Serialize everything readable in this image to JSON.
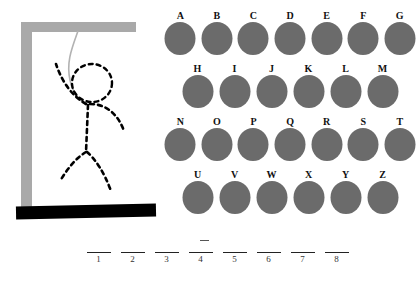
{
  "game": {
    "title": "Hangman",
    "colors": {
      "gallows_wood": "#a9a9a9",
      "gallows_base": "#000000",
      "letter_circle": "#6b6b6b",
      "figure_stroke": "#000000",
      "rope": "#b0b0b0",
      "background": "#ffffff"
    }
  },
  "gallows": {
    "post_label": "gallows-post",
    "beam_label": "gallows-beam",
    "base_label": "gallows-base",
    "rope_label": "hangman-rope",
    "figure_parts": [
      "head",
      "torso",
      "left-arm",
      "right-arm",
      "left-leg",
      "right-leg"
    ],
    "wrong_guesses_shown": 6
  },
  "letters": {
    "rows": [
      {
        "indented": false,
        "keys": [
          "A",
          "B",
          "C",
          "D",
          "E",
          "F",
          "G"
        ]
      },
      {
        "indented": true,
        "keys": [
          "H",
          "I",
          "J",
          "K",
          "L",
          "M"
        ]
      },
      {
        "indented": false,
        "keys": [
          "N",
          "O",
          "P",
          "Q",
          "R",
          "S",
          "T"
        ]
      },
      {
        "indented": true,
        "keys": [
          "U",
          "V",
          "W",
          "X",
          "Y",
          "Z"
        ]
      }
    ]
  },
  "answer": {
    "length": 8,
    "slots": [
      {
        "number": "1",
        "letter": ""
      },
      {
        "number": "2",
        "letter": ""
      },
      {
        "number": "3",
        "letter": ""
      },
      {
        "number": "4",
        "letter": ""
      },
      {
        "number": "5",
        "letter": ""
      },
      {
        "number": "6",
        "letter": ""
      },
      {
        "number": "7",
        "letter": ""
      },
      {
        "number": "8",
        "letter": ""
      }
    ]
  }
}
